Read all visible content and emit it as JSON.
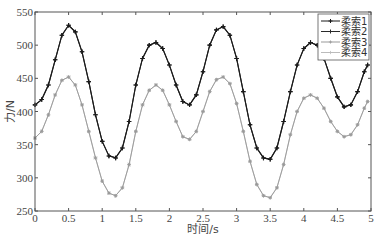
{
  "chart_data": {
    "type": "line",
    "title": "",
    "xlabel": "时间/s",
    "ylabel": "力/N",
    "xlim": [
      0,
      5
    ],
    "ylim": [
      250,
      550
    ],
    "xticks": [
      0,
      0.5,
      1,
      1.5,
      2,
      2.5,
      3,
      3.5,
      4,
      4.5,
      5
    ],
    "xtick_labels": [
      "0",
      "0.5",
      "1",
      "1.5",
      "2",
      "2.5",
      "3",
      "3.5",
      "4",
      "4.5",
      "5"
    ],
    "yticks": [
      250,
      300,
      350,
      400,
      450,
      500,
      550
    ],
    "ytick_labels": [
      "250",
      "300",
      "350",
      "400",
      "450",
      "500",
      "550"
    ],
    "grid": false,
    "legend_position": "upper right",
    "x": [
      0,
      0.1,
      0.2,
      0.3,
      0.4,
      0.5,
      0.6,
      0.7,
      0.8,
      0.9,
      1.0,
      1.1,
      1.2,
      1.3,
      1.4,
      1.5,
      1.6,
      1.7,
      1.8,
      1.9,
      2.0,
      2.1,
      2.2,
      2.3,
      2.4,
      2.5,
      2.6,
      2.7,
      2.8,
      2.9,
      3.0,
      3.1,
      3.2,
      3.3,
      3.4,
      3.5,
      3.6,
      3.7,
      3.8,
      3.9,
      4.0,
      4.1,
      4.2,
      4.3,
      4.4,
      4.5,
      4.6,
      4.7,
      4.8,
      4.9,
      4.95
    ],
    "series": [
      {
        "name": "柔索1",
        "color": "#1a1a1a",
        "marker": "+",
        "values": [
          410,
          418,
          440,
          478,
          515,
          530,
          520,
          490,
          445,
          395,
          355,
          333,
          330,
          345,
          385,
          440,
          480,
          500,
          504,
          495,
          470,
          440,
          415,
          410,
          425,
          460,
          500,
          523,
          528,
          515,
          480,
          430,
          380,
          345,
          330,
          328,
          345,
          385,
          430,
          470,
          495,
          504,
          500,
          480,
          450,
          422,
          407,
          410,
          430,
          460,
          470
        ]
      },
      {
        "name": "柔索2",
        "color": "#2a2a2a",
        "marker": "+",
        "values": [
          410,
          418,
          440,
          478,
          515,
          530,
          520,
          490,
          445,
          395,
          355,
          333,
          330,
          345,
          385,
          440,
          480,
          500,
          504,
          495,
          470,
          440,
          415,
          410,
          425,
          460,
          500,
          523,
          528,
          515,
          480,
          430,
          380,
          345,
          330,
          328,
          345,
          385,
          430,
          470,
          495,
          504,
          500,
          480,
          450,
          422,
          407,
          410,
          430,
          460,
          470
        ]
      },
      {
        "name": "柔索3",
        "color": "#999999",
        "marker": "*",
        "values": [
          360,
          370,
          395,
          425,
          447,
          452,
          440,
          410,
          370,
          330,
          295,
          277,
          273,
          285,
          320,
          370,
          410,
          432,
          440,
          432,
          410,
          385,
          362,
          358,
          370,
          400,
          430,
          448,
          452,
          442,
          412,
          370,
          325,
          290,
          273,
          270,
          285,
          320,
          365,
          400,
          420,
          425,
          420,
          405,
          385,
          370,
          362,
          365,
          380,
          405,
          415
        ]
      },
      {
        "name": "柔索4",
        "color": "#bbbbbb",
        "marker": "*",
        "values": [
          360,
          370,
          395,
          425,
          447,
          452,
          440,
          410,
          370,
          330,
          295,
          277,
          273,
          285,
          320,
          370,
          410,
          432,
          440,
          432,
          410,
          385,
          362,
          358,
          370,
          400,
          430,
          448,
          452,
          442,
          412,
          370,
          325,
          290,
          273,
          270,
          285,
          320,
          365,
          400,
          420,
          425,
          420,
          405,
          385,
          370,
          362,
          365,
          380,
          405,
          415
        ]
      }
    ]
  }
}
